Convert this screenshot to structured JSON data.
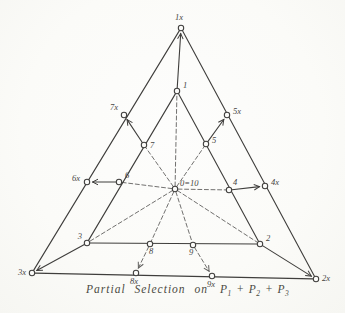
{
  "figure": {
    "caption": {
      "prefix": "Partial Selection on",
      "separator": "+",
      "terms": [
        {
          "base": "P",
          "sub": "1"
        },
        {
          "base": "P",
          "sub": "2"
        },
        {
          "base": "P",
          "sub": "3"
        }
      ]
    },
    "colors": {
      "ink": "#3f3e3c",
      "paper": "#fbfbf9",
      "label": "#45443f"
    },
    "center_point_id": "0",
    "points": {
      "0": {
        "label": "0=10",
        "x": 175,
        "y": 189,
        "lx": 180,
        "ly": 186,
        "anchor": "start"
      },
      "1": {
        "label": "1",
        "x": 177,
        "y": 91,
        "lx": 183,
        "ly": 88,
        "anchor": "start"
      },
      "2": {
        "label": "2",
        "x": 260,
        "y": 244,
        "lx": 266,
        "ly": 241,
        "anchor": "start"
      },
      "3": {
        "label": "3",
        "x": 87,
        "y": 243,
        "lx": 82,
        "ly": 239,
        "anchor": "end"
      },
      "4": {
        "label": "4",
        "x": 229,
        "y": 190,
        "lx": 233,
        "ly": 185,
        "anchor": "start"
      },
      "5": {
        "label": "5",
        "x": 206,
        "y": 144,
        "lx": 212,
        "ly": 143,
        "anchor": "start"
      },
      "6": {
        "label": "6",
        "x": 119,
        "y": 182,
        "lx": 125,
        "ly": 178,
        "anchor": "start"
      },
      "7": {
        "label": "7",
        "x": 144,
        "y": 145,
        "lx": 150,
        "ly": 148,
        "anchor": "start"
      },
      "8": {
        "label": "8",
        "x": 150,
        "y": 244,
        "lx": 151,
        "ly": 254,
        "anchor": "middle"
      },
      "9": {
        "label": "9",
        "x": 193,
        "y": 245,
        "lx": 191,
        "ly": 255,
        "anchor": "middle"
      },
      "1x": {
        "label": "1x",
        "x": 181,
        "y": 28,
        "lx": 179,
        "ly": 20,
        "anchor": "middle"
      },
      "2x": {
        "label": "2x",
        "x": 316,
        "y": 279,
        "lx": 322,
        "ly": 281,
        "anchor": "start"
      },
      "3x": {
        "label": "3x",
        "x": 32,
        "y": 273,
        "lx": 26,
        "ly": 275,
        "anchor": "end"
      },
      "4x": {
        "label": "4x",
        "x": 265,
        "y": 186,
        "lx": 271,
        "ly": 185,
        "anchor": "start"
      },
      "5x": {
        "label": "5x",
        "x": 227,
        "y": 115,
        "lx": 233,
        "ly": 114,
        "anchor": "start"
      },
      "6x": {
        "label": "6x",
        "x": 87,
        "y": 182,
        "lx": 80,
        "ly": 181,
        "anchor": "end"
      },
      "7x": {
        "label": "7x",
        "x": 124,
        "y": 115,
        "lx": 118,
        "ly": 110,
        "anchor": "end"
      },
      "8x": {
        "label": "8x",
        "x": 136,
        "y": 273,
        "lx": 134,
        "ly": 284,
        "anchor": "middle"
      },
      "9x": {
        "label": "9x",
        "x": 212,
        "y": 276,
        "lx": 211,
        "ly": 287,
        "anchor": "middle"
      }
    },
    "edges": [
      {
        "from": "1x",
        "to": "3x",
        "style": "solid"
      },
      {
        "from": "3x",
        "to": "2x",
        "style": "solid"
      },
      {
        "from": "2x",
        "to": "1x",
        "style": "solid"
      },
      {
        "from": "1",
        "to": "3",
        "style": "solid"
      },
      {
        "from": "3",
        "to": "2",
        "style": "solid"
      },
      {
        "from": "2",
        "to": "1",
        "style": "solid"
      },
      {
        "from": "0",
        "to": "1",
        "style": "dashed"
      },
      {
        "from": "0",
        "to": "2",
        "style": "dashed"
      },
      {
        "from": "0",
        "to": "3",
        "style": "dashed"
      },
      {
        "from": "0",
        "to": "4",
        "style": "dashed"
      },
      {
        "from": "0",
        "to": "5",
        "style": "dashed"
      },
      {
        "from": "0",
        "to": "6",
        "style": "dashed"
      },
      {
        "from": "0",
        "to": "7",
        "style": "dashed"
      },
      {
        "from": "0",
        "to": "8",
        "style": "dashed"
      },
      {
        "from": "0",
        "to": "9",
        "style": "dashed"
      },
      {
        "from": "1",
        "to": "1x",
        "style": "solid",
        "arrow": true
      },
      {
        "from": "2",
        "to": "2x",
        "style": "solid",
        "arrow": true
      },
      {
        "from": "3",
        "to": "3x",
        "style": "solid",
        "arrow": true
      },
      {
        "from": "4",
        "to": "4x",
        "style": "solid",
        "arrow": true
      },
      {
        "from": "5",
        "to": "5x",
        "style": "solid",
        "arrow": true
      },
      {
        "from": "6",
        "to": "6x",
        "style": "solid",
        "arrow": true
      },
      {
        "from": "7",
        "to": "7x",
        "style": "solid",
        "arrow": true
      },
      {
        "from": "8",
        "to": "8x",
        "style": "dashed",
        "arrow": true
      },
      {
        "from": "9",
        "to": "9x",
        "style": "dashed",
        "arrow": true
      }
    ]
  }
}
